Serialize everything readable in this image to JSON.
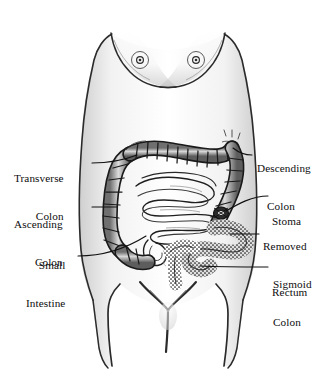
{
  "figure": {
    "background_color": "#ffffff",
    "ink_color": "#111111",
    "shading_color": "#9a9a9a"
  },
  "labels": {
    "transverse_colon": {
      "line1": "Transverse",
      "line2": "Colon"
    },
    "ascending_colon": {
      "line1": "Ascending",
      "line2": "Colon"
    },
    "small_intestine": {
      "line1": "Small",
      "line2": "Intestine"
    },
    "descending_colon": {
      "line1": "Descending",
      "line2": "Colon"
    },
    "stoma": {
      "line1": "Stoma"
    },
    "removed_sigmoid_colon": {
      "line1": "Removed",
      "line2": "Sigmoid",
      "line3": "Colon"
    },
    "rectum": {
      "line1": "Rectum"
    }
  },
  "anatomy_parts": [
    "transverse-colon",
    "ascending-colon",
    "descending-colon",
    "small-intestine",
    "cecum",
    "stoma",
    "removed-sigmoid-colon",
    "rectum",
    "torso-outline",
    "breasts",
    "navel"
  ]
}
